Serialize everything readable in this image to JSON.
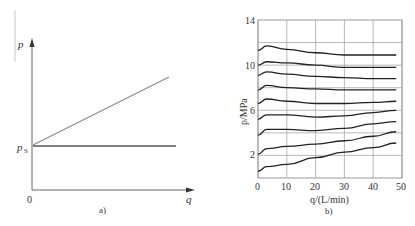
{
  "figure": {
    "panel_a_caption": "a)",
    "panel_b_caption": "b)"
  },
  "panel_a": {
    "y_axis_label": "p",
    "x_axis_label": "q",
    "origin_label": "0",
    "ps_label_main": "p",
    "ps_label_sub": "S"
  },
  "panel_b": {
    "y_axis_label": "p/MPa",
    "x_axis_label": "q/(L/min)",
    "y_ticks": [
      "2",
      "6",
      "10",
      "14"
    ],
    "x_ticks": [
      "0",
      "10",
      "20",
      "30",
      "40",
      "50"
    ]
  },
  "chart_data": [
    {
      "type": "line",
      "title": "a)",
      "xlabel": "q",
      "ylabel": "p",
      "annotations": [
        "p_S",
        "0"
      ],
      "series": [
        {
          "name": "rising line",
          "x": [
            0,
            1
          ],
          "values": [
            1,
            2.5
          ]
        },
        {
          "name": "constant p_S",
          "x": [
            0,
            1.05
          ],
          "values": [
            1,
            1
          ]
        }
      ],
      "grid": false
    },
    {
      "type": "line",
      "title": "b)",
      "xlabel": "q/(L/min)",
      "ylabel": "p/MPa",
      "xlim": [
        0,
        50
      ],
      "ylim": [
        0,
        14
      ],
      "x_ticks": [
        0,
        10,
        20,
        30,
        40,
        50
      ],
      "y_ticks": [
        2,
        6,
        10,
        14
      ],
      "grid": true,
      "x": [
        0,
        3,
        10,
        20,
        30,
        40,
        48
      ],
      "series": [
        {
          "name": "curve 1",
          "values": [
            11.3,
            11.7,
            11.4,
            11.1,
            10.9,
            10.9,
            10.9
          ]
        },
        {
          "name": "curve 2",
          "values": [
            10.0,
            10.3,
            10.2,
            10.0,
            9.8,
            9.8,
            9.8
          ]
        },
        {
          "name": "curve 3",
          "values": [
            9.1,
            9.4,
            9.2,
            9.0,
            8.9,
            8.8,
            8.8
          ]
        },
        {
          "name": "curve 4",
          "values": [
            7.8,
            8.2,
            8.0,
            7.9,
            7.8,
            7.8,
            7.8
          ]
        },
        {
          "name": "curve 5",
          "values": [
            6.6,
            7.0,
            6.8,
            6.6,
            6.6,
            6.7,
            6.8
          ]
        },
        {
          "name": "curve 6",
          "values": [
            5.2,
            5.6,
            5.6,
            5.4,
            5.5,
            5.8,
            6.0
          ]
        },
        {
          "name": "curve 7",
          "values": [
            3.8,
            4.3,
            4.3,
            4.2,
            4.4,
            4.8,
            5.0
          ]
        },
        {
          "name": "curve 8",
          "values": [
            2.1,
            2.6,
            2.8,
            3.0,
            3.3,
            3.7,
            4.1
          ]
        },
        {
          "name": "curve 9",
          "values": [
            0.6,
            1.0,
            1.2,
            1.8,
            2.3,
            2.7,
            3.1
          ]
        }
      ]
    }
  ]
}
